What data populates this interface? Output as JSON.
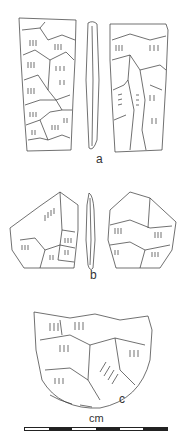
{
  "figure": {
    "artifacts": [
      {
        "id": "a",
        "label": "a",
        "description": "blade tool, two faces and side profile"
      },
      {
        "id": "b",
        "label": "b",
        "description": "pentagonal flake tool, two faces and side profile"
      },
      {
        "id": "c",
        "label": "c",
        "description": "semicircular scraper, single face"
      }
    ],
    "scale": {
      "unit_label": "cm",
      "segments": [
        "#ffffff",
        "#222222",
        "#ffffff",
        "#222222",
        "#ffffff",
        "#222222"
      ]
    },
    "colors": {
      "line": "#333333",
      "background": "#ffffff"
    }
  }
}
